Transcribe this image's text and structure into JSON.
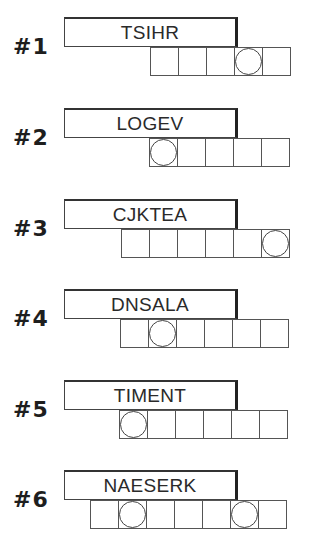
{
  "puzzles": [
    {
      "label": "#1",
      "scrambled": "TSIHR",
      "cells": 5,
      "circled": [
        3
      ],
      "top": 17,
      "cells_left": 150
    },
    {
      "label": "#2",
      "scrambled": "LOGEV",
      "cells": 5,
      "circled": [
        0
      ],
      "top": 108,
      "cells_left": 149
    },
    {
      "label": "#3",
      "scrambled": "CJKTEA",
      "cells": 6,
      "circled": [
        5
      ],
      "top": 199,
      "cells_left": 121
    },
    {
      "label": "#4",
      "scrambled": "DNSALA",
      "cells": 6,
      "circled": [
        1
      ],
      "top": 289,
      "cells_left": 120
    },
    {
      "label": "#5",
      "scrambled": "TIMENT",
      "cells": 6,
      "circled": [
        0
      ],
      "top": 380,
      "cells_left": 119
    },
    {
      "label": "#6",
      "scrambled": "NAESERK",
      "cells": 7,
      "circled": [
        1,
        5
      ],
      "top": 470,
      "cells_left": 90
    }
  ]
}
